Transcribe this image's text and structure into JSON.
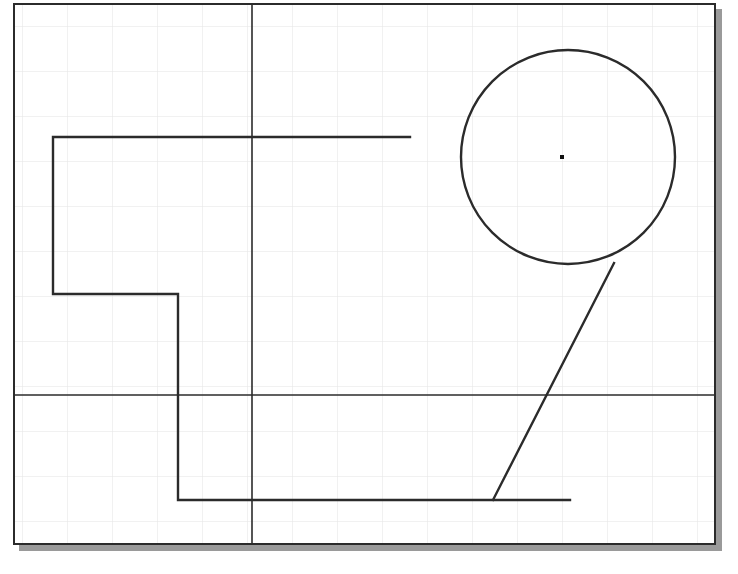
{
  "canvas": {
    "name": "cad-drawing-canvas",
    "width": 738,
    "height": 574,
    "background_color": "#ffffff",
    "frame": {
      "x": 13,
      "y": 3,
      "width": 703,
      "height": 542,
      "border_color": "#2b2b2b",
      "border_width": 2,
      "fill_color": "#ffffff"
    },
    "shadow": {
      "color": "#9a9a9a",
      "offset_x": 6,
      "offset_y": 6
    }
  },
  "grid": {
    "spacing": 45,
    "origin_x": 22,
    "origin_y": 26,
    "color": "#e3e3e3",
    "line_width": 1,
    "visible": true
  },
  "geometry": {
    "construction_lines": [
      {
        "id": "vertical-construction-line",
        "orientation": "vertical",
        "x1": 252,
        "y1": 3,
        "x2": 252,
        "y2": 545,
        "color": "#2b2b2b",
        "width": 1.6
      },
      {
        "id": "horizontal-construction-line",
        "orientation": "horizontal",
        "x1": 13,
        "y1": 395,
        "x2": 716,
        "y2": 395,
        "color": "#2b2b2b",
        "width": 1.6
      }
    ],
    "polyline": {
      "id": "stepped-profile-polyline",
      "color": "#2b2b2b",
      "width": 2.4,
      "points": "410,137 53,137 53,294 178,294 178,500 570,500"
    },
    "circle": {
      "id": "main-circle",
      "center_x": 568,
      "center_y": 157,
      "radius": 107,
      "color": "#2b2b2b",
      "width": 2.4,
      "fill": "none"
    },
    "center_marker": {
      "id": "circle-center-point",
      "x": 562,
      "y": 157,
      "size": 4,
      "color": "#111111"
    },
    "diagonal_line": {
      "id": "tangent-diagonal-line",
      "x1": 493,
      "y1": 500,
      "x2": 614,
      "y2": 263,
      "color": "#2b2b2b",
      "width": 2.4
    }
  }
}
